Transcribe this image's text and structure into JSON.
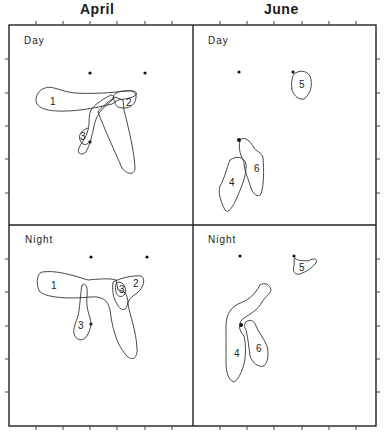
{
  "figure": {
    "columns": [
      {
        "title": "April"
      },
      {
        "title": "June"
      }
    ],
    "panels": [
      {
        "id": "april-day",
        "label": "Day",
        "dots": [
          [
            90,
            73
          ],
          [
            145,
            73
          ],
          [
            90,
            142
          ]
        ],
        "regions": [
          {
            "id": "1",
            "label": "1",
            "label_pos": [
              53,
              102
            ]
          },
          {
            "id": "2",
            "label": "2",
            "label_pos": [
              129,
              106
            ]
          },
          {
            "id": "3",
            "label": "3",
            "label_pos": [
              83,
              137
            ]
          }
        ]
      },
      {
        "id": "june-day",
        "label": "Day",
        "dots": [
          [
            239,
            72
          ],
          [
            293,
            72
          ],
          [
            239,
            140
          ]
        ],
        "regions": [
          {
            "id": "5",
            "label": "5",
            "label_pos": [
              303,
              87
            ]
          },
          {
            "id": "6",
            "label": "6",
            "label_pos": [
              257,
              172
            ]
          },
          {
            "id": "4",
            "label": "4",
            "label_pos": [
              232,
              185
            ]
          }
        ]
      },
      {
        "id": "april-night",
        "label": "Night",
        "dots": [
          [
            91,
            257
          ],
          [
            147,
            257
          ],
          [
            91,
            324
          ]
        ],
        "regions": [
          {
            "id": "1",
            "label": "1",
            "label_pos": [
              54,
              287
            ]
          },
          {
            "id": "3a",
            "label": "3",
            "label_pos": [
              123,
              291
            ]
          },
          {
            "id": "2",
            "label": "2",
            "label_pos": [
              136,
              285
            ]
          },
          {
            "id": "3b",
            "label": "3",
            "label_pos": [
              82,
              327
            ]
          }
        ]
      },
      {
        "id": "june-night",
        "label": "Night",
        "dots": [
          [
            240,
            256
          ],
          [
            294,
            256
          ],
          [
            241,
            325
          ]
        ],
        "regions": [
          {
            "id": "5",
            "label": "5",
            "label_pos": [
              302,
              271
            ]
          },
          {
            "id": "4",
            "label": "4",
            "label_pos": [
              237,
              356
            ]
          },
          {
            "id": "6",
            "label": "6",
            "label_pos": [
              259,
              351
            ]
          }
        ]
      }
    ]
  }
}
